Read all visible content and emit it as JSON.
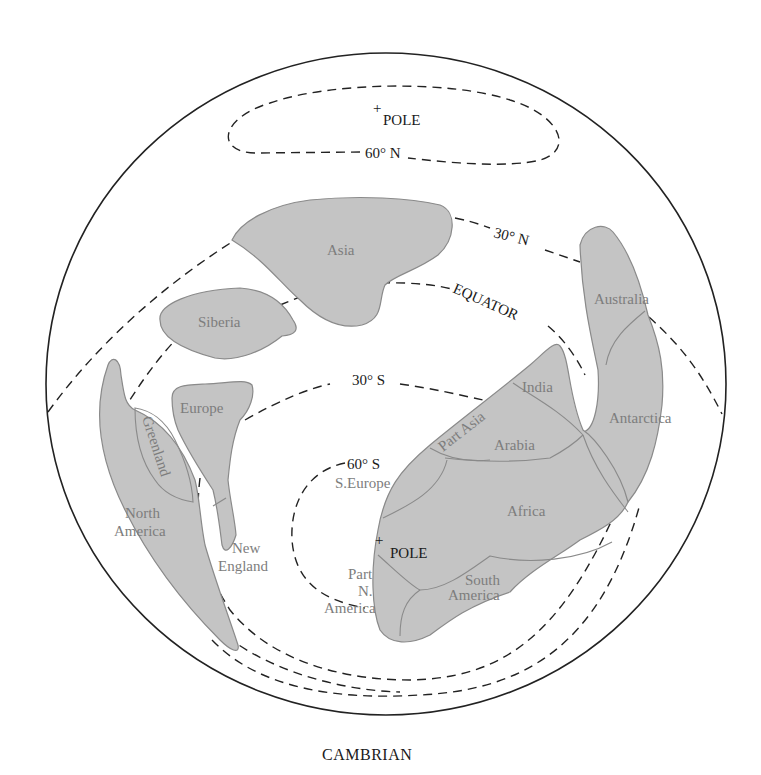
{
  "map": {
    "caption": "CAMBRIAN",
    "projection": "globe",
    "colors": {
      "land": "#c4c4c4",
      "land_outline": "#8a8a8a",
      "lines": "#222222",
      "land_label": "#7d7d7d"
    },
    "poles": [
      {
        "label": "POLE",
        "hemisphere": "north"
      },
      {
        "label": "POLE",
        "hemisphere": "south"
      }
    ],
    "latitude_lines": {
      "n60": "60° N",
      "n30": "30° N",
      "equator": "EQUATOR",
      "s30": "30° S",
      "s60": "60° S"
    },
    "landmasses": {
      "asia": "Asia",
      "siberia": "Siberia",
      "europe": "Europe",
      "greenland": "Greenland",
      "north_america_1": "North",
      "north_america_2": "America",
      "new_england_1": "New",
      "new_england_2": "England",
      "australia": "Australia",
      "antarctica": "Antarctica",
      "india": "India",
      "part_asia": "Part Asia",
      "arabia": "Arabia",
      "s_europe": "S.Europe",
      "africa": "Africa",
      "part_na_1": "Part",
      "part_na_2": "N.",
      "part_na_3": "America",
      "south_america_1": "South",
      "south_america_2": "America"
    }
  }
}
